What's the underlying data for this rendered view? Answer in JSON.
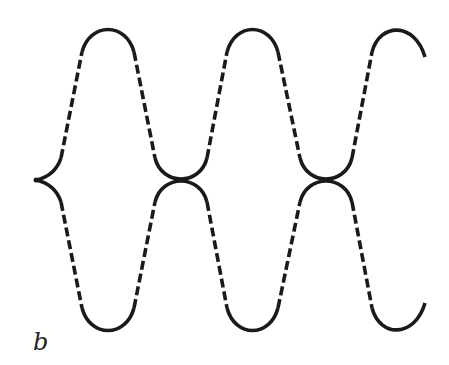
{
  "figure": {
    "label": "b",
    "stroke_color": "#1a1a1a",
    "background": "#ffffff",
    "cusp": {
      "x": 36,
      "y": 180
    },
    "crossings": [
      {
        "x": 181,
        "y": 180
      },
      {
        "x": 326,
        "y": 180
      }
    ],
    "upper_peaks": [
      {
        "x": 108,
        "y": 32
      },
      {
        "x": 252,
        "y": 32
      },
      {
        "x": 397,
        "y": 32
      }
    ],
    "lower_troughs": [
      {
        "x": 108,
        "y": 330
      },
      {
        "x": 252,
        "y": 330
      },
      {
        "x": 397,
        "y": 330
      }
    ]
  }
}
